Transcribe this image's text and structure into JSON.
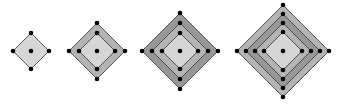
{
  "diagram": {
    "colors": {
      "background": "#ffffff",
      "inner_fill": "#d6d6d6",
      "ring_fill_light": "#b4b4b4",
      "ring_fill_dark": "#989898",
      "stroke": "#333333",
      "dot": "#000000"
    },
    "figures": [
      {
        "cx": 31,
        "cy": 51,
        "radii": [
          18
        ]
      },
      {
        "cx": 97,
        "cy": 51,
        "radii": [
          28,
          18
        ]
      },
      {
        "cx": 180,
        "cy": 51,
        "radii": [
          38,
          28,
          18
        ]
      },
      {
        "cx": 283,
        "cy": 51,
        "radii": [
          46,
          37,
          28,
          19
        ]
      }
    ]
  }
}
